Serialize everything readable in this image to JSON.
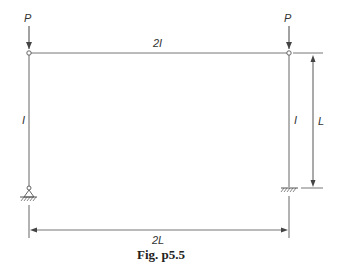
{
  "figure": {
    "caption": "Fig. p5.5",
    "labels": {
      "load_left": "P",
      "load_right": "P",
      "beam_inertia": "2I",
      "left_column_inertia": "I",
      "right_column_inertia": "I",
      "column_height": "L",
      "span": "2L"
    },
    "supports": {
      "left": "pinned",
      "right": "fixed"
    },
    "colors": {
      "line": "#555555",
      "background": "#ffffff"
    }
  }
}
